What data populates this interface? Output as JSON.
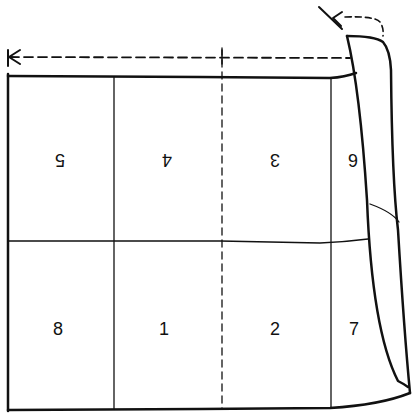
{
  "diagram": {
    "type": "folding-imposition-sheet",
    "colors": {
      "ink": "#111111",
      "background": "#ffffff"
    },
    "panels": {
      "top_row": [
        {
          "label": "5",
          "orientation": "upside-down"
        },
        {
          "label": "4",
          "orientation": "upside-down"
        },
        {
          "label": "3",
          "orientation": "upside-down"
        },
        {
          "label": "6",
          "orientation": "upside-down"
        }
      ],
      "bottom_row": [
        {
          "label": "8",
          "orientation": "upright"
        },
        {
          "label": "1",
          "orientation": "upright"
        },
        {
          "label": "2",
          "orientation": "upright"
        },
        {
          "label": "7",
          "orientation": "upright"
        }
      ]
    },
    "annotations": {
      "fold_arrow_top": "dashed arrow indicating fold toward left edge",
      "fold_arrow_corner": "dashed curved arrow indicating flap fold",
      "center_fold_line": "dashed vertical fold line"
    }
  }
}
